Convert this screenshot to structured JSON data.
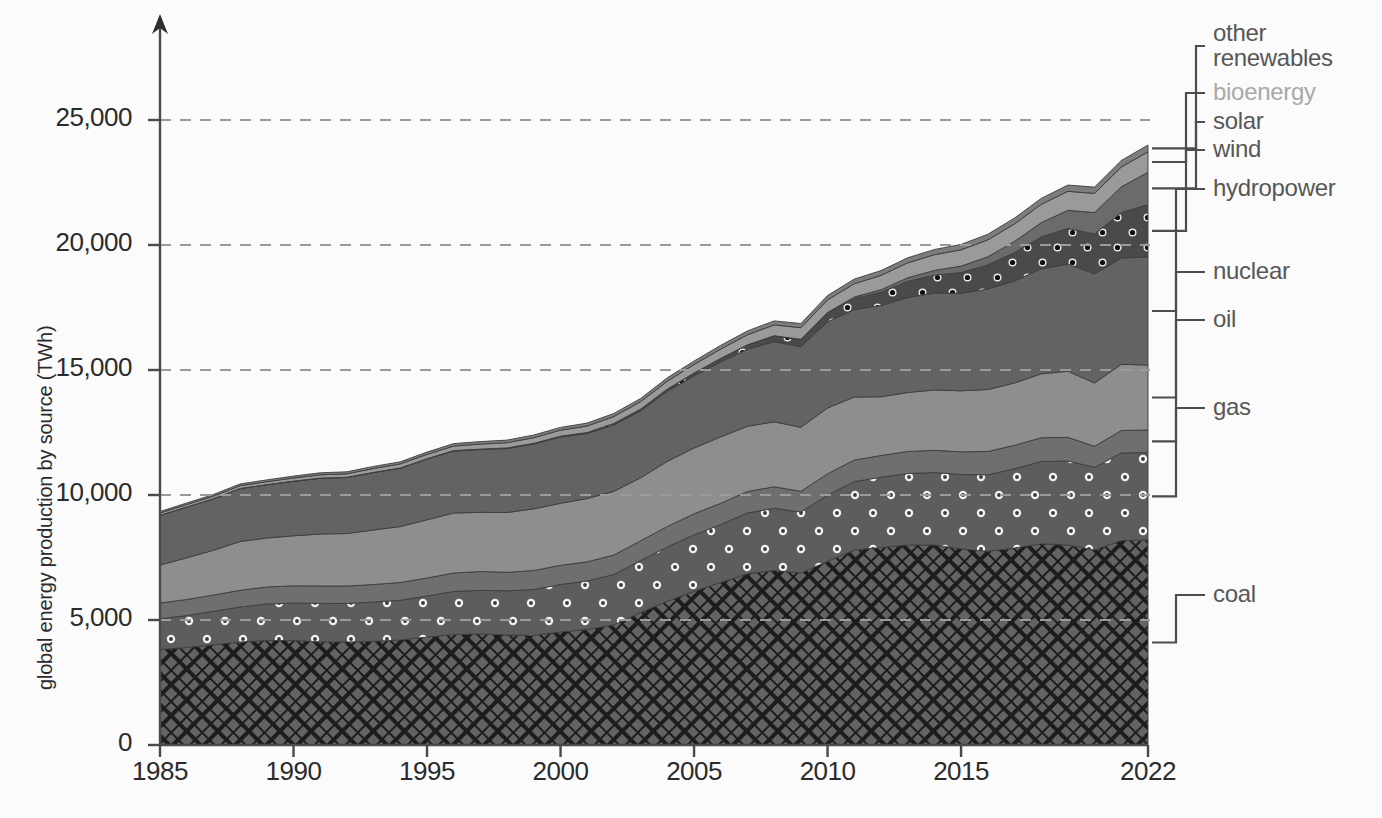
{
  "axes": {
    "ylabel": "global energy production by source (TWh)",
    "yticks": [
      "0",
      "5,000",
      "10,000",
      "15,000",
      "20,000",
      "25,000"
    ],
    "xticks": [
      "1985",
      "1990",
      "1995",
      "2000",
      "2005",
      "2010",
      "2015",
      "2022"
    ]
  },
  "legend": [
    {
      "key": "other_renewables",
      "label_line1": "other",
      "label_line2": "renewables",
      "faint": false
    },
    {
      "key": "bioenergy",
      "label_line1": "bioenergy",
      "label_line2": "",
      "faint": true
    },
    {
      "key": "solar",
      "label_line1": "solar",
      "label_line2": "",
      "faint": false
    },
    {
      "key": "wind",
      "label_line1": "wind",
      "label_line2": "",
      "faint": false
    },
    {
      "key": "hydropower",
      "label_line1": "hydropower",
      "label_line2": "",
      "faint": false
    },
    {
      "key": "nuclear",
      "label_line1": "nuclear",
      "label_line2": "",
      "faint": false
    },
    {
      "key": "oil",
      "label_line1": "oil",
      "label_line2": "",
      "faint": false
    },
    {
      "key": "gas",
      "label_line1": "gas",
      "label_line2": "",
      "faint": false
    },
    {
      "key": "coal",
      "label_line1": "coal",
      "label_line2": "",
      "faint": false
    }
  ],
  "colors": {
    "coal": "#5c5c5c",
    "gas": "#5a5a5a",
    "oil": "#6f6f6f",
    "nuclear": "#8e8e8e",
    "hydropower": "#636363",
    "wind": "#4e4e4e",
    "solar": "#6b6b6b",
    "bioenergy": "#9a9a9a",
    "other_renewables": "#7d7d7d",
    "axis": "#4a4a4a",
    "gridline": "#9b9b9b",
    "text": "#2b2b2b",
    "legend_text": "#575757",
    "background": "#fbfbfb"
  },
  "chart_data": {
    "type": "area",
    "title": "",
    "xlabel": "",
    "ylabel": "global energy production by source (TWh)",
    "stacked": true,
    "grid": true,
    "legend_position": "right",
    "xlim": [
      1985,
      2022
    ],
    "ylim": [
      0,
      28500
    ],
    "x": [
      1985,
      1986,
      1987,
      1988,
      1989,
      1990,
      1991,
      1992,
      1993,
      1994,
      1995,
      1996,
      1997,
      1998,
      1999,
      2000,
      2001,
      2002,
      2003,
      2004,
      2005,
      2006,
      2007,
      2008,
      2009,
      2010,
      2011,
      2012,
      2013,
      2014,
      2015,
      2016,
      2017,
      2018,
      2019,
      2020,
      2021,
      2022
    ],
    "series": [
      {
        "name": "coal",
        "pattern": "crosshatch-diamond",
        "values": [
          3820,
          3900,
          4010,
          4120,
          4180,
          4180,
          4130,
          4120,
          4150,
          4200,
          4320,
          4420,
          4450,
          4400,
          4390,
          4520,
          4620,
          4810,
          5300,
          5750,
          6150,
          6500,
          6850,
          6980,
          6880,
          7350,
          7800,
          7900,
          8000,
          8000,
          7850,
          7750,
          7880,
          8050,
          8000,
          7800,
          8180,
          8200
        ]
      },
      {
        "name": "gas",
        "pattern": "dots-white",
        "values": [
          1230,
          1280,
          1340,
          1400,
          1460,
          1500,
          1540,
          1540,
          1570,
          1590,
          1640,
          1720,
          1740,
          1770,
          1830,
          1900,
          1940,
          2010,
          2080,
          2170,
          2260,
          2320,
          2430,
          2490,
          2440,
          2640,
          2740,
          2810,
          2860,
          2900,
          2970,
          3060,
          3170,
          3290,
          3360,
          3310,
          3500,
          3500
        ]
      },
      {
        "name": "oil",
        "pattern": "solid",
        "values": [
          630,
          640,
          650,
          670,
          680,
          690,
          690,
          700,
          700,
          710,
          720,
          740,
          750,
          740,
          760,
          770,
          770,
          780,
          790,
          820,
          840,
          850,
          860,
          860,
          830,
          860,
          860,
          870,
          880,
          890,
          910,
          930,
          940,
          950,
          950,
          840,
          900,
          900
        ]
      },
      {
        "name": "nuclear",
        "pattern": "solid",
        "values": [
          1520,
          1670,
          1790,
          1950,
          1960,
          2000,
          2080,
          2100,
          2180,
          2240,
          2330,
          2400,
          2370,
          2390,
          2470,
          2480,
          2530,
          2550,
          2520,
          2610,
          2630,
          2660,
          2610,
          2600,
          2560,
          2630,
          2520,
          2350,
          2360,
          2410,
          2440,
          2480,
          2490,
          2560,
          2640,
          2530,
          2650,
          2600
        ]
      },
      {
        "name": "hydropower",
        "pattern": "solid",
        "values": [
          1990,
          2030,
          2060,
          2120,
          2130,
          2180,
          2230,
          2240,
          2300,
          2330,
          2430,
          2480,
          2510,
          2560,
          2590,
          2650,
          2600,
          2660,
          2680,
          2800,
          2890,
          3000,
          3080,
          3210,
          3220,
          3450,
          3500,
          3650,
          3800,
          3880,
          3900,
          4020,
          4080,
          4200,
          4290,
          4370,
          4250,
          4320
        ]
      },
      {
        "name": "wind",
        "pattern": "dots-white-small",
        "values": [
          0,
          1,
          2,
          3,
          4,
          4,
          5,
          6,
          8,
          10,
          12,
          14,
          17,
          21,
          26,
          31,
          38,
          52,
          63,
          85,
          104,
          133,
          170,
          219,
          276,
          342,
          434,
          532,
          646,
          712,
          831,
          959,
          1139,
          1270,
          1425,
          1590,
          1815,
          2100
        ]
      },
      {
        "name": "solar",
        "pattern": "solid",
        "values": [
          0,
          0,
          0,
          0,
          0,
          0,
          0,
          0,
          0,
          0,
          0,
          1,
          1,
          1,
          1,
          1,
          2,
          2,
          3,
          4,
          5,
          7,
          9,
          13,
          20,
          32,
          64,
          100,
          140,
          190,
          255,
          328,
          445,
          573,
          724,
          855,
          1035,
          1290
        ]
      },
      {
        "name": "bioenergy",
        "pattern": "solid",
        "values": [
          90,
          96,
          103,
          110,
          118,
          126,
          135,
          143,
          152,
          162,
          172,
          185,
          197,
          210,
          224,
          240,
          258,
          276,
          296,
          318,
          342,
          370,
          400,
          430,
          465,
          500,
          535,
          570,
          600,
          630,
          650,
          675,
          700,
          730,
          760,
          770,
          790,
          820
        ]
      },
      {
        "name": "other_renewables",
        "pattern": "solid",
        "values": [
          60,
          63,
          66,
          69,
          72,
          75,
          78,
          81,
          84,
          88,
          92,
          96,
          100,
          104,
          108,
          113,
          118,
          123,
          128,
          134,
          140,
          147,
          154,
          161,
          168,
          176,
          184,
          192,
          200,
          208,
          216,
          224,
          232,
          240,
          248,
          252,
          260,
          268
        ]
      }
    ],
    "stack_order_bottom_to_top": [
      "coal",
      "gas",
      "oil",
      "nuclear",
      "hydropower",
      "wind",
      "solar",
      "bioenergy",
      "other_renewables"
    ]
  },
  "plot_geometry": {
    "left_px": 160,
    "right_px": 1148,
    "top_px": 20,
    "bottom_px": 745,
    "y_per_unit_px": 0.025
  }
}
